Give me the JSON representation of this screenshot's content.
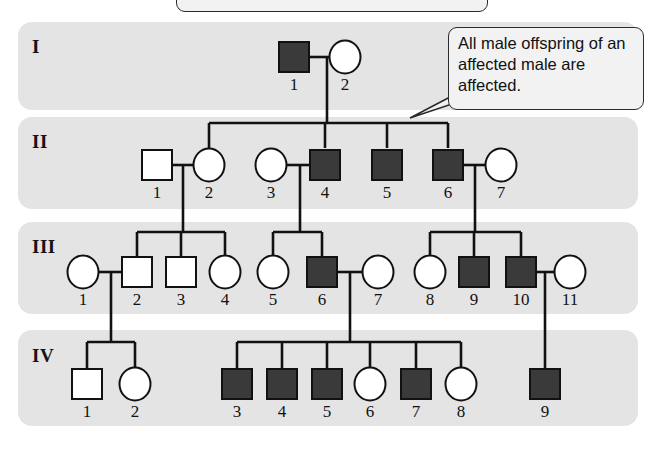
{
  "figure": {
    "title_box_text": "",
    "callout": {
      "text": "All male offspring of an affected male are affected."
    }
  },
  "legend": {
    "affected_color": "#3a3a3a",
    "unaffected_color": "#ffffff",
    "band_color": "#e4e4e4",
    "line_color": "#111111"
  },
  "generations": [
    {
      "label": "I",
      "band": {
        "x": 18,
        "y": 22,
        "w": 620,
        "h": 88
      },
      "label_pos": {
        "x": 32,
        "y": 36
      },
      "individuals": [
        {
          "id": "I-1",
          "number": "1",
          "sex": "male",
          "shape": "square",
          "affected": true,
          "cx": 294,
          "cy": 57
        },
        {
          "id": "I-2",
          "number": "2",
          "sex": "female",
          "shape": "circle",
          "affected": false,
          "cx": 345,
          "cy": 57
        }
      ]
    },
    {
      "label": "II",
      "band": {
        "x": 18,
        "y": 117,
        "w": 620,
        "h": 92
      },
      "label_pos": {
        "x": 32,
        "y": 131
      },
      "individuals": [
        {
          "id": "II-1",
          "number": "1",
          "sex": "male",
          "shape": "square",
          "affected": false,
          "cx": 157,
          "cy": 165
        },
        {
          "id": "II-2",
          "number": "2",
          "sex": "female",
          "shape": "circle",
          "affected": false,
          "cx": 209,
          "cy": 165
        },
        {
          "id": "II-3",
          "number": "3",
          "sex": "female",
          "shape": "circle",
          "affected": false,
          "cx": 271,
          "cy": 165
        },
        {
          "id": "II-4",
          "number": "4",
          "sex": "male",
          "shape": "square",
          "affected": true,
          "cx": 325,
          "cy": 165
        },
        {
          "id": "II-5",
          "number": "5",
          "sex": "male",
          "shape": "square",
          "affected": true,
          "cx": 387,
          "cy": 165
        },
        {
          "id": "II-6",
          "number": "6",
          "sex": "male",
          "shape": "square",
          "affected": true,
          "cx": 448,
          "cy": 165
        },
        {
          "id": "II-7",
          "number": "7",
          "sex": "female",
          "shape": "circle",
          "affected": false,
          "cx": 501,
          "cy": 165
        }
      ]
    },
    {
      "label": "III",
      "band": {
        "x": 18,
        "y": 222,
        "w": 620,
        "h": 92
      },
      "label_pos": {
        "x": 32,
        "y": 236
      },
      "individuals": [
        {
          "id": "III-1",
          "number": "1",
          "sex": "female",
          "shape": "circle",
          "affected": false,
          "cx": 83,
          "cy": 272
        },
        {
          "id": "III-2",
          "number": "2",
          "sex": "male",
          "shape": "square",
          "affected": false,
          "cx": 137,
          "cy": 272
        },
        {
          "id": "III-3",
          "number": "3",
          "sex": "male",
          "shape": "square",
          "affected": false,
          "cx": 181,
          "cy": 272
        },
        {
          "id": "III-4",
          "number": "4",
          "sex": "female",
          "shape": "circle",
          "affected": false,
          "cx": 225,
          "cy": 272
        },
        {
          "id": "III-5",
          "number": "5",
          "sex": "female",
          "shape": "circle",
          "affected": false,
          "cx": 273,
          "cy": 272
        },
        {
          "id": "III-6",
          "number": "6",
          "sex": "male",
          "shape": "square",
          "affected": true,
          "cx": 322,
          "cy": 272
        },
        {
          "id": "III-7",
          "number": "7",
          "sex": "female",
          "shape": "circle",
          "affected": false,
          "cx": 378,
          "cy": 272
        },
        {
          "id": "III-8",
          "number": "8",
          "sex": "female",
          "shape": "circle",
          "affected": false,
          "cx": 430,
          "cy": 272
        },
        {
          "id": "III-9",
          "number": "9",
          "sex": "male",
          "shape": "square",
          "affected": true,
          "cx": 474,
          "cy": 272
        },
        {
          "id": "III-10",
          "number": "10",
          "sex": "male",
          "shape": "square",
          "affected": true,
          "cx": 521,
          "cy": 272
        },
        {
          "id": "III-11",
          "number": "11",
          "sex": "female",
          "shape": "circle",
          "affected": false,
          "cx": 570,
          "cy": 272
        }
      ]
    },
    {
      "label": "IV",
      "band": {
        "x": 18,
        "y": 330,
        "w": 620,
        "h": 96
      },
      "label_pos": {
        "x": 32,
        "y": 345
      },
      "individuals": [
        {
          "id": "IV-1",
          "number": "1",
          "sex": "male",
          "shape": "square",
          "affected": false,
          "cx": 87,
          "cy": 384
        },
        {
          "id": "IV-2",
          "number": "2",
          "sex": "female",
          "shape": "circle",
          "affected": false,
          "cx": 135,
          "cy": 384
        },
        {
          "id": "IV-3",
          "number": "3",
          "sex": "male",
          "shape": "square",
          "affected": true,
          "cx": 237,
          "cy": 384
        },
        {
          "id": "IV-4",
          "number": "4",
          "sex": "male",
          "shape": "square",
          "affected": true,
          "cx": 282,
          "cy": 384
        },
        {
          "id": "IV-5",
          "number": "5",
          "sex": "male",
          "shape": "square",
          "affected": true,
          "cx": 327,
          "cy": 384
        },
        {
          "id": "IV-6",
          "number": "6",
          "sex": "female",
          "shape": "circle",
          "affected": false,
          "cx": 370,
          "cy": 384
        },
        {
          "id": "IV-7",
          "number": "7",
          "sex": "male",
          "shape": "square",
          "affected": true,
          "cx": 416,
          "cy": 384
        },
        {
          "id": "IV-8",
          "number": "8",
          "sex": "female",
          "shape": "circle",
          "affected": false,
          "cx": 461,
          "cy": 384
        },
        {
          "id": "IV-9",
          "number": "9",
          "sex": "male",
          "shape": "square",
          "affected": true,
          "cx": 545,
          "cy": 384
        }
      ]
    }
  ],
  "matings": [
    {
      "id": "mating-I-1-x-I-2",
      "partners": [
        "I-1",
        "I-2"
      ],
      "line_y": 57,
      "x1": 307,
      "x2": 331,
      "drop_x": 327
    },
    {
      "id": "mating-II-1-x-II-2",
      "partners": [
        "II-1",
        "II-2"
      ],
      "line_y": 165,
      "x1": 172,
      "x2": 195,
      "drop_x": 183
    },
    {
      "id": "mating-II-3-x-II-4",
      "partners": [
        "II-3",
        "II-4"
      ],
      "line_y": 165,
      "x1": 285,
      "x2": 310,
      "drop_x": 300
    },
    {
      "id": "mating-II-6-x-II-7",
      "partners": [
        "II-6",
        "II-7"
      ],
      "line_y": 165,
      "x1": 463,
      "x2": 487,
      "drop_x": 475
    },
    {
      "id": "mating-III-1-x-III-2",
      "partners": [
        "III-1",
        "III-2"
      ],
      "line_y": 272,
      "x1": 97,
      "x2": 122,
      "drop_x": 111
    },
    {
      "id": "mating-III-6-x-III-7",
      "partners": [
        "III-6",
        "III-7"
      ],
      "line_y": 272,
      "x1": 337,
      "x2": 363,
      "drop_x": 350
    },
    {
      "id": "mating-III-10-x-III-11",
      "partners": [
        "III-10",
        "III-11"
      ],
      "line_y": 272,
      "x1": 536,
      "x2": 556,
      "drop_x": 545
    }
  ],
  "sibships": [
    {
      "id": "sibship-gen-II",
      "parent_mating": "mating-I-1-x-I-2",
      "bar_y": 123,
      "drop_from_y": 57,
      "children_x": [
        209,
        325,
        387,
        448
      ],
      "child_top_y": 148
    },
    {
      "id": "sibship-gen-III-left",
      "parent_mating": "mating-II-1-x-II-2",
      "bar_y": 232,
      "drop_from_y": 165,
      "children_x": [
        137,
        181,
        225
      ],
      "child_top_y": 256
    },
    {
      "id": "sibship-gen-III-mid",
      "parent_mating": "mating-II-3-x-II-4",
      "bar_y": 232,
      "drop_from_y": 165,
      "children_x": [
        273,
        322
      ],
      "child_top_y": 256
    },
    {
      "id": "sibship-gen-III-right",
      "parent_mating": "mating-II-6-x-II-7",
      "bar_y": 232,
      "drop_from_y": 165,
      "children_x": [
        430,
        474,
        521
      ],
      "child_top_y": 256
    },
    {
      "id": "sibship-gen-IV-left",
      "parent_mating": "mating-III-1-x-III-2",
      "bar_y": 342,
      "drop_from_y": 272,
      "children_x": [
        87,
        135
      ],
      "child_top_y": 368
    },
    {
      "id": "sibship-gen-IV-mid",
      "parent_mating": "mating-III-6-x-III-7",
      "bar_y": 342,
      "drop_from_y": 272,
      "children_x": [
        237,
        282,
        327,
        370,
        416,
        461
      ],
      "child_top_y": 368
    },
    {
      "id": "sibship-gen-IV-right",
      "parent_mating": "mating-III-10-x-III-11",
      "bar_y": 342,
      "drop_from_y": 272,
      "children_x": [
        545
      ],
      "child_top_y": 368
    }
  ],
  "callout_box": {
    "x": 448,
    "y": 27,
    "w": 196,
    "h": 83,
    "pointer": [
      [
        452,
        96
      ],
      [
        410,
        118
      ],
      [
        452,
        104
      ]
    ]
  },
  "title_box": {
    "x": 176,
    "y": -18,
    "w": 312,
    "h": 30
  }
}
